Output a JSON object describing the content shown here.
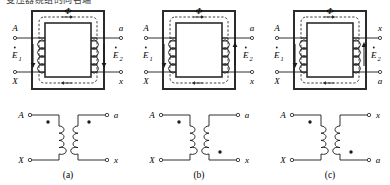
{
  "figure": {
    "caption_top_partial": "变压器绕组的同名端",
    "panels": [
      {
        "id": "a",
        "label": "(a)",
        "core_flux_label": "Φ",
        "left_terminal_top": "A",
        "left_terminal_bottom": "X",
        "right_terminal_top": "a",
        "right_terminal_bottom": "x",
        "emf_left_label": "E",
        "emf_left_sub": "1",
        "emf_right_label": "E",
        "emf_right_sub": "2",
        "emf_left_direction": "down",
        "emf_right_direction": "down",
        "dot_left_position": "top",
        "dot_right_position": "top",
        "winding_right_sense": "same",
        "circuit_left_top": "A",
        "circuit_left_bottom": "X",
        "circuit_right_top": "a",
        "circuit_right_bottom": "x"
      },
      {
        "id": "b",
        "label": "(b)",
        "core_flux_label": "Φ",
        "left_terminal_top": "A",
        "left_terminal_bottom": "X",
        "right_terminal_top": "a",
        "right_terminal_bottom": "x",
        "emf_left_label": "E",
        "emf_left_sub": "1",
        "emf_right_label": "E",
        "emf_right_sub": "2",
        "emf_left_direction": "down",
        "emf_right_direction": "up",
        "dot_left_position": "top",
        "dot_right_position": "bottom",
        "winding_right_sense": "reversed",
        "circuit_left_top": "A",
        "circuit_left_bottom": "X",
        "circuit_right_top": "a",
        "circuit_right_bottom": "x"
      },
      {
        "id": "c",
        "label": "(c)",
        "core_flux_label": "Φ",
        "left_terminal_top": "A",
        "left_terminal_bottom": "X",
        "right_terminal_top": "x",
        "right_terminal_bottom": "a",
        "emf_left_label": "E",
        "emf_left_sub": "1",
        "emf_right_label": "E",
        "emf_right_sub": "2",
        "emf_left_direction": "down",
        "emf_right_direction": "up",
        "dot_left_position": "top",
        "dot_right_position": "bottom",
        "winding_right_sense": "same",
        "circuit_left_top": "A",
        "circuit_left_bottom": "X",
        "circuit_right_top": "x",
        "circuit_right_bottom": "a"
      }
    ],
    "colors": {
      "line": "#1a1a1a",
      "core": "#2b2b2b",
      "flux_dashed": "#2b2b2b",
      "background": "#ffffff"
    }
  }
}
